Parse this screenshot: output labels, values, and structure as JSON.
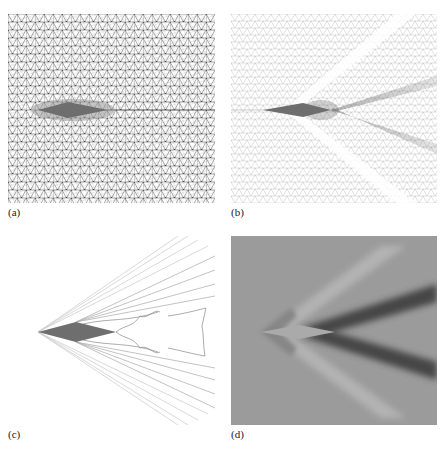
{
  "figure": {
    "panels": [
      {
        "id": "a",
        "label": "(a)",
        "description": "Unstructured triangular mesh around a diamond airfoil, refined near the body"
      },
      {
        "id": "b",
        "label": "(b)",
        "description": "Adapted mesh with refinement along oblique shocks and expansion fans"
      },
      {
        "id": "c",
        "label": "(c)",
        "description": "Contour lines of the flow solution showing shock and expansion wave structure"
      },
      {
        "id": "d",
        "label": "(d)",
        "description": "Grayscale shaded flow field with dark shock bands trailing the airfoil"
      }
    ],
    "colors": {
      "mesh_line": "#555555",
      "adapted_mesh_line": "#b8b8b8",
      "airfoil": "#6e6e6e",
      "contour_line": "#9a9a9a",
      "field_background": "#9b9b9b",
      "shock_dark": "#3a3a3a",
      "expansion_light": "#b4b4b4"
    }
  }
}
